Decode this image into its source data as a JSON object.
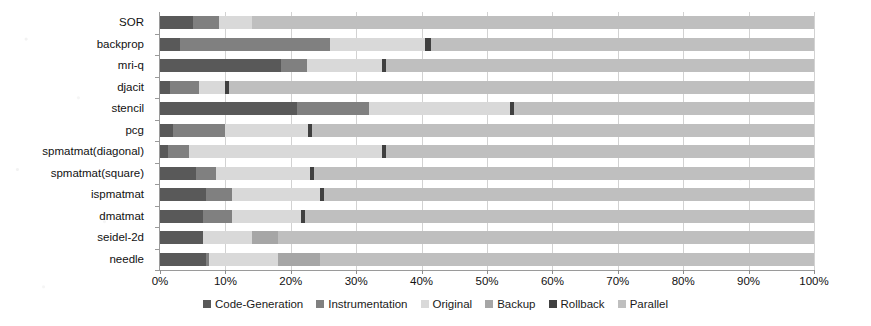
{
  "chart_data": {
    "type": "bar",
    "orientation": "horizontal",
    "stacked": true,
    "normalized": true,
    "title": "",
    "subtitle": "",
    "xlabel": "",
    "ylabel": "",
    "xlim": [
      0,
      100
    ],
    "xticks": [
      0,
      10,
      20,
      30,
      40,
      50,
      60,
      70,
      80,
      90,
      100
    ],
    "xtick_labels": [
      "0%",
      "10%",
      "20%",
      "30%",
      "40%",
      "50%",
      "60%",
      "70%",
      "80%",
      "90%",
      "100%"
    ],
    "grid": "vertical",
    "legend_position": "bottom",
    "categories": [
      "SOR",
      "backprop",
      "mri-q",
      "djacit",
      "stencil",
      "pcg",
      "spmatmat(diagonal)",
      "spmatmat(square)",
      "ispmatmat",
      "dmatmat",
      "seidel-2d",
      "needle"
    ],
    "series": [
      {
        "name": "Code-Generation",
        "color": "#595959",
        "values": [
          5.0,
          3.0,
          18.5,
          1.5,
          21.0,
          2.0,
          1.2,
          5.5,
          7.0,
          6.5,
          6.5,
          7.0
        ]
      },
      {
        "name": "Instrumentation",
        "color": "#808080",
        "values": [
          4.0,
          23.0,
          4.0,
          4.5,
          11.0,
          8.0,
          3.3,
          3.0,
          4.0,
          4.5,
          0.0,
          0.5
        ]
      },
      {
        "name": "Original",
        "color": "#d9d9d9",
        "values": [
          5.0,
          14.5,
          11.5,
          4.0,
          21.5,
          12.7,
          29.5,
          14.5,
          13.5,
          10.5,
          7.5,
          10.5
        ]
      },
      {
        "name": "Backup",
        "color": "#a6a6a6",
        "values": [
          0.0,
          0.0,
          0.0,
          0.0,
          0.0,
          0.0,
          0.0,
          0.0,
          0.0,
          0.0,
          4.0,
          6.5
        ]
      },
      {
        "name": "Rollback",
        "color": "#404040",
        "values": [
          0.0,
          1.0,
          0.6,
          0.5,
          0.7,
          0.6,
          0.6,
          0.6,
          0.6,
          0.6,
          0.0,
          0.0
        ]
      },
      {
        "name": "Parallel",
        "color": "#bfbfbf",
        "values": [
          86.0,
          58.5,
          65.4,
          89.5,
          45.8,
          76.7,
          65.4,
          76.4,
          74.9,
          77.9,
          82.0,
          75.5
        ]
      }
    ]
  },
  "legend": {
    "items": [
      {
        "label": "Code-Generation"
      },
      {
        "label": "Instrumentation"
      },
      {
        "label": "Original"
      },
      {
        "label": "Backup"
      },
      {
        "label": "Rollback"
      },
      {
        "label": "Parallel"
      }
    ]
  },
  "colors": {
    "code_generation": "#595959",
    "instrumentation": "#808080",
    "original": "#d9d9d9",
    "backup": "#a6a6a6",
    "rollback": "#404040",
    "parallel": "#bfbfbf",
    "gridline": "#d2d2d2",
    "axis": "#9a9a9a",
    "text": "#111111",
    "background": "#ffffff"
  }
}
